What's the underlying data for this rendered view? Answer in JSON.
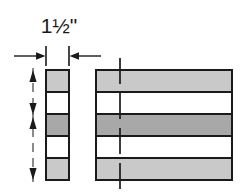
{
  "drawing": {
    "title": "layered-block-dimension-diagram",
    "dimension_label": "1½\"",
    "colors": {
      "outline": "#1a1a1a",
      "band_gray_light": "#c9c9c9",
      "band_gray_dark": "#a8a8a8",
      "band_white": "#ffffff",
      "background": "#ffffff",
      "dimension_line": "#1a1a1a",
      "center_line": "#1a1a1a"
    },
    "edge_view": {
      "name": "narrow-edge-view-stack",
      "x": 46,
      "y": 70,
      "width": 23,
      "height": 110,
      "band_count": 5,
      "bands": [
        {
          "index": 1,
          "fill": "#c9c9c9",
          "label": "band-1-gray"
        },
        {
          "index": 2,
          "fill": "#ffffff",
          "label": "band-2-white"
        },
        {
          "index": 3,
          "fill": "#a8a8a8",
          "label": "band-3-dark-gray"
        },
        {
          "index": 4,
          "fill": "#ffffff",
          "label": "band-4-white"
        },
        {
          "index": 5,
          "fill": "#c9c9c9",
          "label": "band-5-gray"
        }
      ]
    },
    "face_view": {
      "name": "wide-face-view-block",
      "x": 96,
      "y": 70,
      "width": 136,
      "height": 110,
      "band_count": 5,
      "bands": [
        {
          "index": 1,
          "fill": "#c9c9c9",
          "label": "band-1-gray"
        },
        {
          "index": 2,
          "fill": "#ffffff",
          "label": "band-2-white"
        },
        {
          "index": 3,
          "fill": "#a8a8a8",
          "label": "band-3-dark-gray"
        },
        {
          "index": 4,
          "fill": "#ffffff",
          "label": "band-4-white"
        },
        {
          "index": 5,
          "fill": "#c9c9c9",
          "label": "band-5-gray"
        }
      ]
    },
    "width_dimension": {
      "name": "width-dimension-1-and-a-half-inch",
      "value": "1½\"",
      "line_y": 56,
      "left_extension_x": 46,
      "right_extension_x": 69,
      "text_x": 59,
      "text_y": 33
    },
    "height_measure_line": {
      "name": "vertical-dash-dot-measure-line",
      "x": 33,
      "top": 68,
      "bottom": 182,
      "arrow_count": 5
    },
    "center_line": {
      "name": "vertical-center-line",
      "x": 120,
      "top": 58,
      "bottom": 192
    }
  }
}
